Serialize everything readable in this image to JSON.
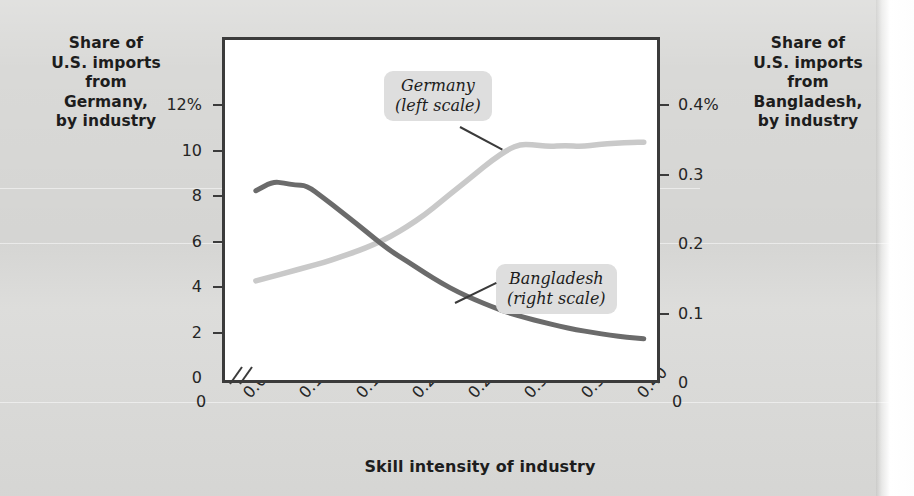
{
  "chart_data": {
    "type": "line",
    "title": "",
    "xlabel": "Skill intensity of industry",
    "ylabel_left": "Share of U.S. imports from Germany, by industry",
    "ylabel_right": "Share of U.S. imports from Bangladesh, by industry",
    "xlim": [
      0.04,
      0.41
    ],
    "xticks": [
      0.05,
      0.1,
      0.15,
      0.2,
      0.25,
      0.3,
      0.35,
      0.4
    ],
    "xtick_labels": [
      "0.05",
      "0.10",
      "0.15",
      "0.20",
      "0.25",
      "0.30",
      "0.35",
      "0.40"
    ],
    "x_origin_label_left": "0",
    "x_origin_label_right": "0",
    "axis_break": true,
    "grid": false,
    "legend_position": "inline-callouts",
    "left_axis": {
      "unit": "%",
      "ylim": [
        0,
        12
      ],
      "ticks": [
        0,
        2,
        4,
        6,
        8,
        10,
        12
      ],
      "tick_labels": [
        "0",
        "2",
        "4",
        "6",
        "8",
        "10",
        "12%"
      ]
    },
    "right_axis": {
      "unit": "%",
      "ylim": [
        0,
        0.4
      ],
      "ticks": [
        0,
        0.1,
        0.2,
        0.3,
        0.4
      ],
      "tick_labels": [
        "0",
        "0.1",
        "0.2",
        "0.3",
        "0.4%"
      ]
    },
    "series": [
      {
        "name": "Germany",
        "scale": "left",
        "callout_line1": "Germany",
        "callout_line2": "(left scale)",
        "color": "#c9c9c9",
        "x": [
          0.055,
          0.07,
          0.085,
          0.1,
          0.115,
          0.13,
          0.145,
          0.16,
          0.175,
          0.19,
          0.205,
          0.22,
          0.235,
          0.25,
          0.265,
          0.28,
          0.29,
          0.3,
          0.315,
          0.33,
          0.345,
          0.36,
          0.375,
          0.39,
          0.4
        ],
        "y": [
          4.4,
          4.6,
          4.8,
          5.0,
          5.2,
          5.45,
          5.7,
          6.0,
          6.35,
          6.8,
          7.3,
          7.9,
          8.5,
          9.1,
          9.7,
          10.2,
          10.4,
          10.4,
          10.3,
          10.35,
          10.3,
          10.4,
          10.45,
          10.5,
          10.5
        ]
      },
      {
        "name": "Bangladesh",
        "scale": "right",
        "callout_line1": "Bangladesh",
        "callout_line2": "(right scale)",
        "color": "#6b6b6b",
        "x": [
          0.055,
          0.07,
          0.08,
          0.09,
          0.1,
          0.115,
          0.13,
          0.145,
          0.16,
          0.175,
          0.19,
          0.205,
          0.22,
          0.235,
          0.25,
          0.265,
          0.28,
          0.295,
          0.31,
          0.325,
          0.34,
          0.355,
          0.37,
          0.385,
          0.4
        ],
        "y": [
          0.281,
          0.294,
          0.292,
          0.289,
          0.289,
          0.271,
          0.252,
          0.233,
          0.213,
          0.194,
          0.179,
          0.163,
          0.148,
          0.135,
          0.124,
          0.114,
          0.105,
          0.098,
          0.092,
          0.086,
          0.081,
          0.077,
          0.073,
          0.07,
          0.068
        ]
      }
    ]
  }
}
